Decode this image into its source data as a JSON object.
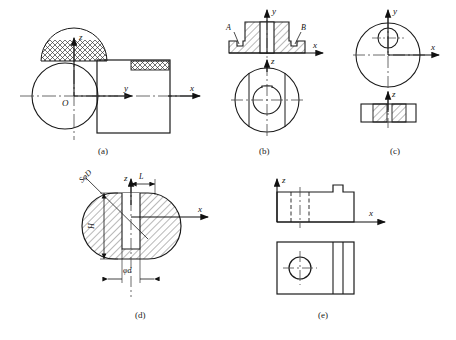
{
  "figure": {
    "stroke_color": "#1a1a1a",
    "hatch_color": "#333333",
    "centerline_color": "#444444"
  },
  "captions": [
    {
      "key": "a",
      "text": "(a)"
    },
    {
      "key": "b",
      "text": "(b)"
    },
    {
      "key": "c",
      "text": "(c)"
    },
    {
      "key": "d",
      "text": "(d)"
    },
    {
      "key": "e",
      "text": "(e)"
    }
  ],
  "panels": {
    "a": {
      "caption": "(a)",
      "axes": [
        {
          "name": "z",
          "label": "z"
        },
        {
          "name": "y",
          "label": "y"
        },
        {
          "name": "x",
          "label": "x"
        }
      ],
      "origin_label": "O",
      "views": [
        {
          "name": "circular-view",
          "shape": "circle",
          "hatch": "cross-hatch-net",
          "hatch_region": "top-segment"
        },
        {
          "name": "rectangular-view",
          "shape": "rectangle",
          "hatch": "cross-hatch-net",
          "hatch_region": "top-right-strip"
        }
      ]
    },
    "b": {
      "caption": "(b)",
      "axes": [
        {
          "name": "y",
          "label": "y"
        },
        {
          "name": "x",
          "label": "x"
        },
        {
          "name": "z",
          "label": "z"
        }
      ],
      "markers": [
        {
          "name": "marker-a",
          "label": "A"
        },
        {
          "name": "marker-b",
          "label": "B"
        }
      ],
      "views": [
        {
          "name": "section-view",
          "shape": "stepped-boss-section",
          "hatch": "diagonal-45"
        },
        {
          "name": "circular-view",
          "shape": "circle-with-keyway-bore"
        }
      ]
    },
    "c": {
      "caption": "(c)",
      "axes": [
        {
          "name": "y",
          "label": "y"
        },
        {
          "name": "x",
          "label": "x"
        },
        {
          "name": "z",
          "label": "z"
        }
      ],
      "views": [
        {
          "name": "circular-view",
          "shape": "circle-with-offset-hole"
        },
        {
          "name": "section-view",
          "shape": "rectangle-two-hatched-cells",
          "hatch": "diagonal-45"
        }
      ]
    },
    "d": {
      "caption": "(d)",
      "axes": [
        {
          "name": "z",
          "label": "z"
        },
        {
          "name": "x",
          "label": "x"
        }
      ],
      "dimensions": [
        {
          "name": "sphere-diameter",
          "label": "SφD"
        },
        {
          "name": "height",
          "label": "H"
        },
        {
          "name": "length",
          "label": "L"
        },
        {
          "name": "shaft-diameter",
          "label": "φd"
        }
      ],
      "views": [
        {
          "name": "sphere-section-view",
          "shape": "sphere-with-flats",
          "hatch": "diagonal-45"
        }
      ]
    },
    "e": {
      "caption": "(e)",
      "axes": [
        {
          "name": "z",
          "label": "z"
        },
        {
          "name": "x",
          "label": "x"
        }
      ],
      "views": [
        {
          "name": "front-view",
          "shape": "block-with-notch-and-hidden-hole"
        },
        {
          "name": "top-view",
          "shape": "block-with-hole-and-slot"
        }
      ]
    }
  }
}
